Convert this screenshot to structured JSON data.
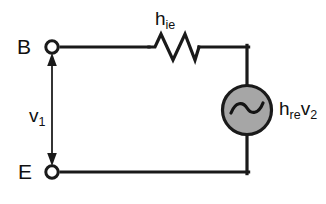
{
  "diagram": {
    "colors": {
      "wire": "#1a1a1a",
      "background": "#ffffff",
      "source_fill": "#a6a6a6",
      "source_stroke": "#1a1a1a",
      "text": "#101010"
    }
  },
  "terminals": [
    {
      "id": "base",
      "label": "B",
      "x": 52,
      "y": 47,
      "node_style": "open-circle"
    },
    {
      "id": "emitter",
      "label": "E",
      "x": 52,
      "y": 172,
      "node_style": "open-circle"
    }
  ],
  "components": {
    "resistor": {
      "name": "input resistance",
      "label_main": "h",
      "label_sub": "ie",
      "symbol": "zigzag",
      "x1": 148,
      "x2": 200,
      "y": 47
    },
    "source": {
      "name": "dependent voltage source",
      "label_main_1": "h",
      "label_sub_1": "re",
      "label_main_2": "v",
      "label_sub_2": "2",
      "symbol": "ac-sine-circle",
      "cx": 247,
      "cy": 110,
      "r": 25
    },
    "voltage_arrow": {
      "name": "input voltage",
      "label_main": "v",
      "label_sub": "1",
      "x": 52,
      "y_top": 58,
      "y_bottom": 161,
      "arrowheads": "both"
    }
  },
  "wires": [
    {
      "name": "top-left-wire",
      "from": [
        60,
        47
      ],
      "to": [
        148,
        47
      ]
    },
    {
      "name": "top-right-wire",
      "from": [
        200,
        47
      ],
      "to": [
        247,
        47
      ]
    },
    {
      "name": "right-upper-wire",
      "from": [
        247,
        47
      ],
      "to": [
        247,
        85
      ]
    },
    {
      "name": "right-lower-wire",
      "from": [
        247,
        135
      ],
      "to": [
        247,
        172
      ]
    },
    {
      "name": "bottom-wire",
      "from": [
        60,
        172
      ],
      "to": [
        247,
        172
      ]
    }
  ]
}
